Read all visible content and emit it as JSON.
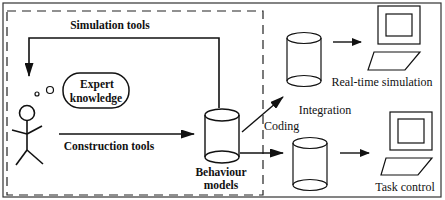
{
  "diagram": {
    "labels": {
      "simulation_tools": "Simulation tools",
      "expert_line1": "Expert",
      "expert_line2": "knowledge",
      "construction_tools": "Construction tools",
      "behaviour_line1": "Behaviour",
      "behaviour_line2": "models",
      "coding": "Coding",
      "integration": "Integration",
      "real_time_simulation": "Real-time simulation",
      "task_control": "Task control"
    },
    "nodes": [
      {
        "id": "user",
        "shape": "stick-figure"
      },
      {
        "id": "expert-knowledge",
        "shape": "thought-bubble",
        "label": "Expert knowledge"
      },
      {
        "id": "behaviour-models",
        "shape": "cylinder",
        "label": "Behaviour models"
      },
      {
        "id": "sim-db",
        "shape": "cylinder"
      },
      {
        "id": "task-db",
        "shape": "cylinder"
      },
      {
        "id": "real-time-computer",
        "shape": "computer",
        "label": "Real-time simulation"
      },
      {
        "id": "task-computer",
        "shape": "computer",
        "label": "Task control"
      }
    ],
    "edges": [
      {
        "from": "behaviour-models",
        "to": "user",
        "label": "Simulation tools"
      },
      {
        "from": "user",
        "to": "behaviour-models",
        "label": "Construction tools"
      },
      {
        "from": "behaviour-models",
        "to": "sim-db",
        "label": "Coding"
      },
      {
        "from": "behaviour-models",
        "to": "task-db",
        "label": "Coding"
      },
      {
        "from": "sim-db",
        "to": "real-time-computer",
        "label": "Integration"
      },
      {
        "from": "task-db",
        "to": "task-computer",
        "label": "Integration"
      }
    ],
    "colors": {
      "stroke": "#111111",
      "background": "#ffffff"
    }
  }
}
